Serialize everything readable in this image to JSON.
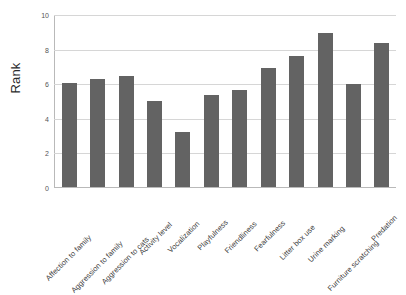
{
  "chart_data": {
    "type": "bar",
    "title": "",
    "xlabel": "",
    "ylabel": "Rank",
    "ylim": [
      0,
      10
    ],
    "yticks": [
      0,
      2,
      4,
      6,
      8,
      10
    ],
    "ytick_labels": [
      "0",
      "2",
      "4",
      "6",
      "8",
      "10"
    ],
    "grid": true,
    "legend": null,
    "bar_color": "#636363",
    "categories": [
      "Affection to family",
      "Aggression to family",
      "Aggression to cats",
      "Activity level",
      "Vocalization",
      "Playfulness",
      "Friendliness",
      "Fearfulness",
      "Litter box use",
      "Urine marking",
      "Furniture scratching",
      "Predation"
    ],
    "values": [
      6.0,
      6.25,
      6.4,
      5.0,
      3.2,
      5.3,
      5.6,
      6.9,
      7.6,
      8.9,
      5.95,
      8.3
    ]
  }
}
